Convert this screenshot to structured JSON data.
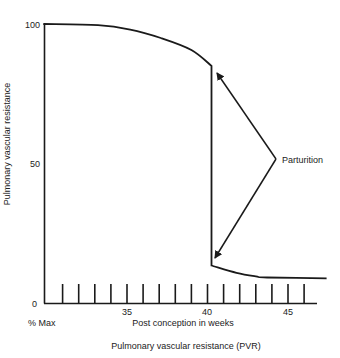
{
  "chart_data": {
    "type": "line",
    "title": "Pulmonary vascular resistance (PVR)",
    "xlabel": "Post conception in weeks",
    "ylabel": "Pulmonary vascular resistance",
    "yunit_label": "% Max",
    "xlim": [
      29.8,
      47.6
    ],
    "ylim": [
      0,
      100
    ],
    "x_ticks": [
      31,
      32,
      33,
      34,
      35,
      36,
      37,
      38,
      39,
      40,
      41,
      42,
      43,
      44,
      45,
      46
    ],
    "x_tick_labels": [
      {
        "value": 35,
        "label": "35"
      },
      {
        "value": 40,
        "label": "40"
      },
      {
        "value": 45,
        "label": "45"
      }
    ],
    "y_tick_labels": [
      {
        "value": 0,
        "label": "0"
      },
      {
        "value": 50,
        "label": "50"
      },
      {
        "value": 100,
        "label": "100"
      }
    ],
    "grid": false,
    "series": [
      {
        "name": "PVR",
        "x": [
          29.8,
          33.2,
          35.2,
          37.1,
          39.0,
          40.25,
          40.25,
          41.8,
          43.0,
          43.7,
          47.4
        ],
        "values": [
          100,
          99.6,
          98,
          95,
          90.7,
          85,
          13.6,
          11,
          9.7,
          9.3,
          9
        ]
      }
    ],
    "annotations": [
      {
        "text": "Parturition",
        "arrows_to": [
          {
            "x": 40.25,
            "y": 85
          },
          {
            "x": 40.25,
            "y": 13.6
          }
        ]
      }
    ]
  },
  "labels": {
    "y100": "100",
    "y50": "50",
    "y0": "0",
    "x35": "35",
    "x40": "40",
    "x45": "45",
    "percent_max": "% Max",
    "x_axis_title": "Post conception in weeks",
    "y_axis_title": "Pulmonary vascular resistance",
    "figure_caption": "Pulmonary vascular resistance (PVR)",
    "annotation": "Parturition"
  },
  "colors": {
    "line": "#1a1a1a",
    "text": "#222222",
    "background": "#ffffff"
  }
}
